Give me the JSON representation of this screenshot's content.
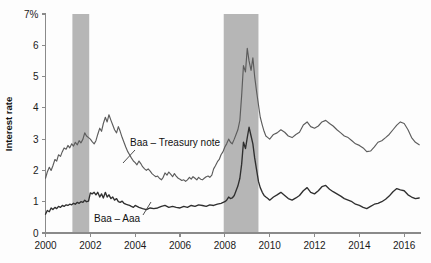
{
  "chart_data": {
    "type": "line",
    "title": "",
    "xlabel": "",
    "ylabel": "Interest rate",
    "ylim": [
      0,
      7
    ],
    "xlim": [
      2000,
      2016.75
    ],
    "grid": false,
    "legend_position": "inline-annotations",
    "ytick_labels": [
      "0",
      "1",
      "2",
      "3",
      "4",
      "5",
      "6",
      "7%"
    ],
    "ytick_values": [
      0,
      1,
      2,
      3,
      4,
      5,
      6,
      7
    ],
    "xtick_labels": [
      "2000",
      "2002",
      "2004",
      "2006",
      "2008",
      "2010",
      "2012",
      "2014",
      "2016"
    ],
    "xtick_values": [
      2000,
      2002,
      2004,
      2006,
      2008,
      2010,
      2012,
      2014,
      2016
    ],
    "annotations": [
      {
        "text": "Baa – Treasury note",
        "x": 2003.55,
        "y": 3.05
      },
      {
        "text": "Baa – Aaa",
        "x": 2002.55,
        "y": 0.62
      }
    ],
    "shaded_regions": [
      {
        "label": "recession",
        "x_start": 2001.2,
        "x_end": 2001.95,
        "color": "#b6b6b6"
      },
      {
        "label": "recession",
        "x_start": 2007.95,
        "x_end": 2009.5,
        "color": "#b6b6b6"
      }
    ],
    "series": [
      {
        "name": "Baa – Treasury note",
        "color": "#5c5c5c",
        "x": [
          2000.0,
          2000.08,
          2000.17,
          2000.25,
          2000.33,
          2000.42,
          2000.5,
          2000.58,
          2000.67,
          2000.75,
          2000.83,
          2000.92,
          2001.0,
          2001.08,
          2001.17,
          2001.25,
          2001.33,
          2001.42,
          2001.5,
          2001.58,
          2001.67,
          2001.75,
          2001.83,
          2001.92,
          2002.0,
          2002.08,
          2002.17,
          2002.25,
          2002.33,
          2002.42,
          2002.5,
          2002.58,
          2002.67,
          2002.75,
          2002.83,
          2002.92,
          2003.0,
          2003.08,
          2003.17,
          2003.25,
          2003.33,
          2003.42,
          2003.5,
          2003.58,
          2003.67,
          2003.75,
          2003.83,
          2003.92,
          2004.0,
          2004.08,
          2004.17,
          2004.25,
          2004.33,
          2004.42,
          2004.5,
          2004.58,
          2004.67,
          2004.75,
          2004.83,
          2004.92,
          2005.0,
          2005.08,
          2005.17,
          2005.25,
          2005.33,
          2005.42,
          2005.5,
          2005.58,
          2005.67,
          2005.75,
          2005.83,
          2005.92,
          2006.0,
          2006.08,
          2006.17,
          2006.25,
          2006.33,
          2006.42,
          2006.5,
          2006.58,
          2006.67,
          2006.75,
          2006.83,
          2006.92,
          2007.0,
          2007.08,
          2007.17,
          2007.25,
          2007.33,
          2007.42,
          2007.5,
          2007.58,
          2007.67,
          2007.75,
          2007.83,
          2007.92,
          2008.0,
          2008.08,
          2008.17,
          2008.25,
          2008.33,
          2008.42,
          2008.5,
          2008.58,
          2008.67,
          2008.75,
          2008.83,
          2008.92,
          2009.0,
          2009.08,
          2009.17,
          2009.25,
          2009.33,
          2009.42,
          2009.5,
          2009.58,
          2009.67,
          2009.75,
          2009.83,
          2009.92,
          2010.0,
          2010.17,
          2010.33,
          2010.5,
          2010.67,
          2010.83,
          2011.0,
          2011.17,
          2011.33,
          2011.5,
          2011.67,
          2011.83,
          2012.0,
          2012.17,
          2012.33,
          2012.5,
          2012.67,
          2012.83,
          2013.0,
          2013.17,
          2013.33,
          2013.5,
          2013.67,
          2013.83,
          2014.0,
          2014.17,
          2014.33,
          2014.5,
          2014.67,
          2014.83,
          2015.0,
          2015.17,
          2015.33,
          2015.5,
          2015.67,
          2015.83,
          2016.0,
          2016.17,
          2016.33,
          2016.5,
          2016.67
        ],
        "values": [
          1.75,
          1.95,
          2.1,
          2.0,
          2.15,
          2.35,
          2.3,
          2.5,
          2.45,
          2.6,
          2.72,
          2.68,
          2.8,
          2.72,
          2.85,
          2.78,
          2.9,
          2.82,
          2.95,
          2.88,
          3.0,
          3.2,
          3.1,
          3.05,
          3.0,
          2.92,
          2.85,
          2.95,
          3.15,
          3.35,
          3.25,
          3.5,
          3.7,
          3.55,
          3.78,
          3.6,
          3.45,
          3.3,
          3.2,
          3.4,
          3.25,
          3.05,
          2.9,
          2.75,
          2.6,
          2.5,
          2.4,
          2.3,
          2.25,
          2.18,
          2.3,
          2.22,
          2.12,
          2.05,
          2.0,
          2.05,
          1.98,
          1.9,
          1.85,
          1.8,
          1.82,
          1.75,
          1.7,
          1.78,
          1.92,
          1.85,
          1.95,
          1.88,
          1.8,
          1.9,
          1.82,
          1.75,
          1.72,
          1.68,
          1.7,
          1.65,
          1.7,
          1.78,
          1.72,
          1.8,
          1.75,
          1.7,
          1.78,
          1.72,
          1.7,
          1.75,
          1.8,
          1.82,
          1.78,
          1.85,
          2.05,
          2.15,
          2.28,
          2.35,
          2.5,
          2.6,
          2.75,
          2.85,
          3.0,
          2.9,
          2.85,
          3.0,
          3.15,
          3.3,
          3.6,
          4.4,
          5.35,
          5.15,
          5.9,
          5.5,
          5.2,
          5.6,
          5.0,
          4.5,
          4.1,
          3.7,
          3.45,
          3.25,
          3.1,
          3.05,
          3.0,
          3.15,
          3.2,
          3.3,
          3.22,
          3.1,
          3.05,
          3.15,
          3.22,
          3.45,
          3.55,
          3.4,
          3.35,
          3.42,
          3.55,
          3.6,
          3.5,
          3.42,
          3.3,
          3.2,
          3.1,
          3.05,
          2.95,
          2.85,
          2.8,
          2.72,
          2.6,
          2.62,
          2.75,
          2.9,
          2.95,
          3.05,
          3.15,
          3.3,
          3.45,
          3.55,
          3.5,
          3.3,
          3.05,
          2.9,
          2.82
        ]
      },
      {
        "name": "Baa – Aaa",
        "color": "#2f2f2f",
        "x": [
          2000.0,
          2000.08,
          2000.17,
          2000.25,
          2000.33,
          2000.42,
          2000.5,
          2000.58,
          2000.67,
          2000.75,
          2000.83,
          2000.92,
          2001.0,
          2001.08,
          2001.17,
          2001.25,
          2001.33,
          2001.42,
          2001.5,
          2001.58,
          2001.67,
          2001.75,
          2001.83,
          2001.92,
          2002.0,
          2002.08,
          2002.17,
          2002.25,
          2002.33,
          2002.42,
          2002.5,
          2002.58,
          2002.67,
          2002.75,
          2002.83,
          2002.92,
          2003.0,
          2003.08,
          2003.17,
          2003.25,
          2003.33,
          2003.42,
          2003.5,
          2003.58,
          2003.67,
          2003.75,
          2003.83,
          2003.92,
          2004.0,
          2004.17,
          2004.33,
          2004.5,
          2004.67,
          2004.83,
          2005.0,
          2005.17,
          2005.33,
          2005.5,
          2005.67,
          2005.83,
          2006.0,
          2006.17,
          2006.33,
          2006.5,
          2006.67,
          2006.83,
          2007.0,
          2007.17,
          2007.33,
          2007.5,
          2007.67,
          2007.83,
          2008.0,
          2008.08,
          2008.17,
          2008.25,
          2008.33,
          2008.42,
          2008.5,
          2008.58,
          2008.67,
          2008.75,
          2008.83,
          2008.92,
          2009.0,
          2009.08,
          2009.17,
          2009.25,
          2009.33,
          2009.42,
          2009.5,
          2009.58,
          2009.67,
          2009.75,
          2009.83,
          2009.92,
          2010.0,
          2010.17,
          2010.33,
          2010.5,
          2010.67,
          2010.83,
          2011.0,
          2011.17,
          2011.33,
          2011.5,
          2011.67,
          2011.83,
          2012.0,
          2012.17,
          2012.33,
          2012.5,
          2012.67,
          2012.83,
          2013.0,
          2013.17,
          2013.33,
          2013.5,
          2013.67,
          2013.83,
          2014.0,
          2014.17,
          2014.33,
          2014.5,
          2014.67,
          2014.83,
          2015.0,
          2015.17,
          2015.33,
          2015.5,
          2015.67,
          2015.83,
          2016.0,
          2016.17,
          2016.33,
          2016.5,
          2016.67
        ],
        "values": [
          0.6,
          0.72,
          0.68,
          0.8,
          0.75,
          0.82,
          0.78,
          0.85,
          0.82,
          0.88,
          0.85,
          0.9,
          0.88,
          0.92,
          0.9,
          0.95,
          0.92,
          0.98,
          0.95,
          1.0,
          0.98,
          1.05,
          1.0,
          1.02,
          1.28,
          1.25,
          1.3,
          1.22,
          1.3,
          1.15,
          1.25,
          1.12,
          1.3,
          1.15,
          1.22,
          1.1,
          1.15,
          1.05,
          1.1,
          1.0,
          0.98,
          1.02,
          0.95,
          0.92,
          0.9,
          0.88,
          0.85,
          0.82,
          0.88,
          0.82,
          0.78,
          0.75,
          0.8,
          0.78,
          0.8,
          0.85,
          0.88,
          0.82,
          0.85,
          0.82,
          0.8,
          0.85,
          0.82,
          0.88,
          0.85,
          0.9,
          0.88,
          0.85,
          0.9,
          0.88,
          0.92,
          0.95,
          1.0,
          1.05,
          1.15,
          1.1,
          1.12,
          1.2,
          1.35,
          1.5,
          1.75,
          2.2,
          2.9,
          2.7,
          3.05,
          3.38,
          3.1,
          2.85,
          2.4,
          2.0,
          1.65,
          1.45,
          1.3,
          1.2,
          1.15,
          1.1,
          1.05,
          1.15,
          1.22,
          1.3,
          1.2,
          1.1,
          1.05,
          1.12,
          1.2,
          1.35,
          1.45,
          1.3,
          1.25,
          1.35,
          1.48,
          1.52,
          1.4,
          1.32,
          1.25,
          1.18,
          1.1,
          1.05,
          1.0,
          0.92,
          0.88,
          0.82,
          0.78,
          0.85,
          0.92,
          0.95,
          1.0,
          1.08,
          1.18,
          1.32,
          1.42,
          1.38,
          1.35,
          1.22,
          1.15,
          1.1,
          1.12
        ]
      }
    ]
  }
}
